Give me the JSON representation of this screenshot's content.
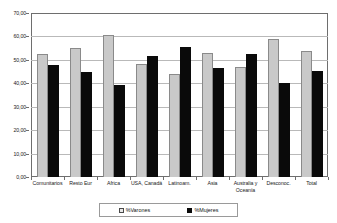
{
  "chart_data": {
    "type": "bar",
    "title": "",
    "xlabel": "",
    "ylabel": "",
    "ylim": [
      0,
      70
    ],
    "ytick_step": 10,
    "grid": true,
    "legend_position": "bottom",
    "ytick_labels": [
      "70,00",
      "60,00",
      "50,00",
      "40,00",
      "30,00",
      "20,00",
      "10,00",
      "0,00"
    ],
    "ytick_values": [
      70,
      60,
      50,
      40,
      30,
      20,
      10,
      0
    ],
    "categories": [
      "Comunitarios",
      "Resto Eur",
      "Africa",
      "USA, Canadá",
      "Latinoam.",
      "Asia",
      "Australia y Oceanía",
      "Desconoc.",
      "Total"
    ],
    "series": [
      {
        "name": "%Varones",
        "color": "#c9c9c9",
        "values": [
          52.5,
          55.0,
          60.5,
          48.2,
          44.1,
          52.8,
          47.0,
          58.8,
          54.0
        ]
      },
      {
        "name": "%Mujeres",
        "color": "#0a0a0a",
        "values": [
          47.8,
          44.8,
          39.4,
          51.5,
          55.3,
          46.6,
          52.3,
          40.3,
          45.1
        ]
      }
    ]
  },
  "legend": {
    "items": [
      {
        "label": "%Varones",
        "swatch": "light-gray-square"
      },
      {
        "label": "%Mujeres",
        "swatch": "black-square"
      }
    ]
  }
}
